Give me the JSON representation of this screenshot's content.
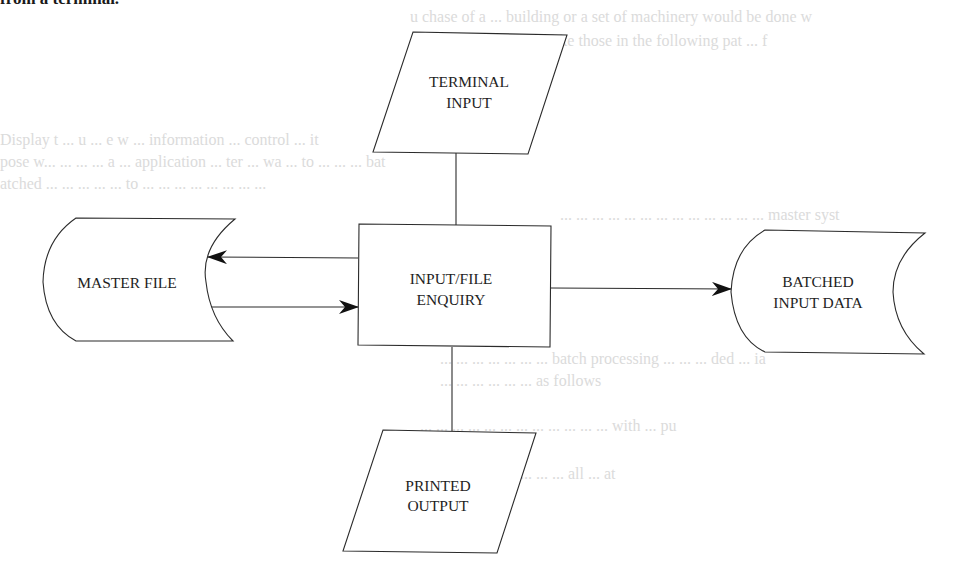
{
  "page": {
    "heading_fragment": "from a terminal.",
    "ghost_lines": [
      {
        "text": "u chase of a ... building or a set of machinery would be done w",
        "x": 410,
        "y": 14
      },
      {
        "text": "record ... the ... like those in the following pat ... f",
        "x": 450,
        "y": 40
      },
      {
        "text": "Display t ... u ... e w ... information ... control ... it",
        "x": 0,
        "y": 140
      },
      {
        "text": "pose w... ... ... ... a ... application ... ter ... wa ... to ... ... ... bat",
        "x": 0,
        "y": 162
      },
      {
        "text": "atched ... ... ... ... ... to ... ... ... ... ... ... ... ...",
        "x": 0,
        "y": 184
      },
      {
        "text": "... ... ... ... ... ... ... ... ... ... ... ... ... master syst",
        "x": 560,
        "y": 215
      },
      {
        "text": "... ... ... ... ... ... ... batch processing ... ... ... ded ... ia",
        "x": 440,
        "y": 358
      },
      {
        "text": "... ... ... ... ... ... as follows",
        "x": 440,
        "y": 380
      },
      {
        "text": "... ... ... ... ... ... ... ... ... ... ... ... with ... pu",
        "x": 420,
        "y": 425
      },
      {
        "text": "... ... ... ... ... ... ... ... all ... at",
        "x": 440,
        "y": 473
      }
    ]
  },
  "diagram": {
    "nodes": [
      {
        "id": "terminal_input",
        "type": "input-output",
        "label_lines": [
          "TERMINAL",
          "INPUT"
        ]
      },
      {
        "id": "input_file_enquiry",
        "type": "process",
        "label_lines": [
          "INPUT/FILE",
          "ENQUIRY"
        ]
      },
      {
        "id": "master_file",
        "type": "storage",
        "label_lines": [
          "MASTER FILE"
        ]
      },
      {
        "id": "batched_input_data",
        "type": "storage",
        "label_lines": [
          "BATCHED",
          "INPUT DATA"
        ]
      },
      {
        "id": "printed_output",
        "type": "input-output",
        "label_lines": [
          "PRINTED",
          "OUTPUT"
        ]
      }
    ],
    "edges": [
      {
        "from": "terminal_input",
        "to": "input_file_enquiry",
        "arrow": "none"
      },
      {
        "from": "input_file_enquiry",
        "to": "master_file",
        "arrow": "end"
      },
      {
        "from": "master_file",
        "to": "input_file_enquiry",
        "arrow": "end"
      },
      {
        "from": "input_file_enquiry",
        "to": "batched_input_data",
        "arrow": "end"
      },
      {
        "from": "input_file_enquiry",
        "to": "printed_output",
        "arrow": "none"
      }
    ],
    "colors": {
      "stroke": "#2b2b2b",
      "arrowhead": "#111111",
      "background": "#ffffff",
      "text": "#1e1e1e"
    }
  }
}
